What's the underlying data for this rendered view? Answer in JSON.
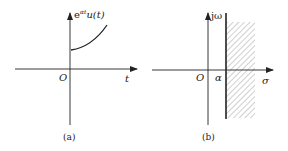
{
  "panels": [
    {
      "id": "a",
      "caption": "(a)",
      "y_axis_label": {
        "base": "e",
        "sup": "αt",
        "rest": "u(t)"
      },
      "x_axis_label": "t",
      "origin_label": "O",
      "curve": "exponential growth starting above origin for t>0"
    },
    {
      "id": "b",
      "caption": "(b)",
      "y_axis_label": "jω",
      "x_axis_label": "σ",
      "origin_label": "O",
      "abscissa_label": "α",
      "region": "hatched region to the right of σ = α (region of convergence)"
    }
  ],
  "colors": {
    "ink": "#222222",
    "hatch": "#777777",
    "background": "#ffffff"
  }
}
